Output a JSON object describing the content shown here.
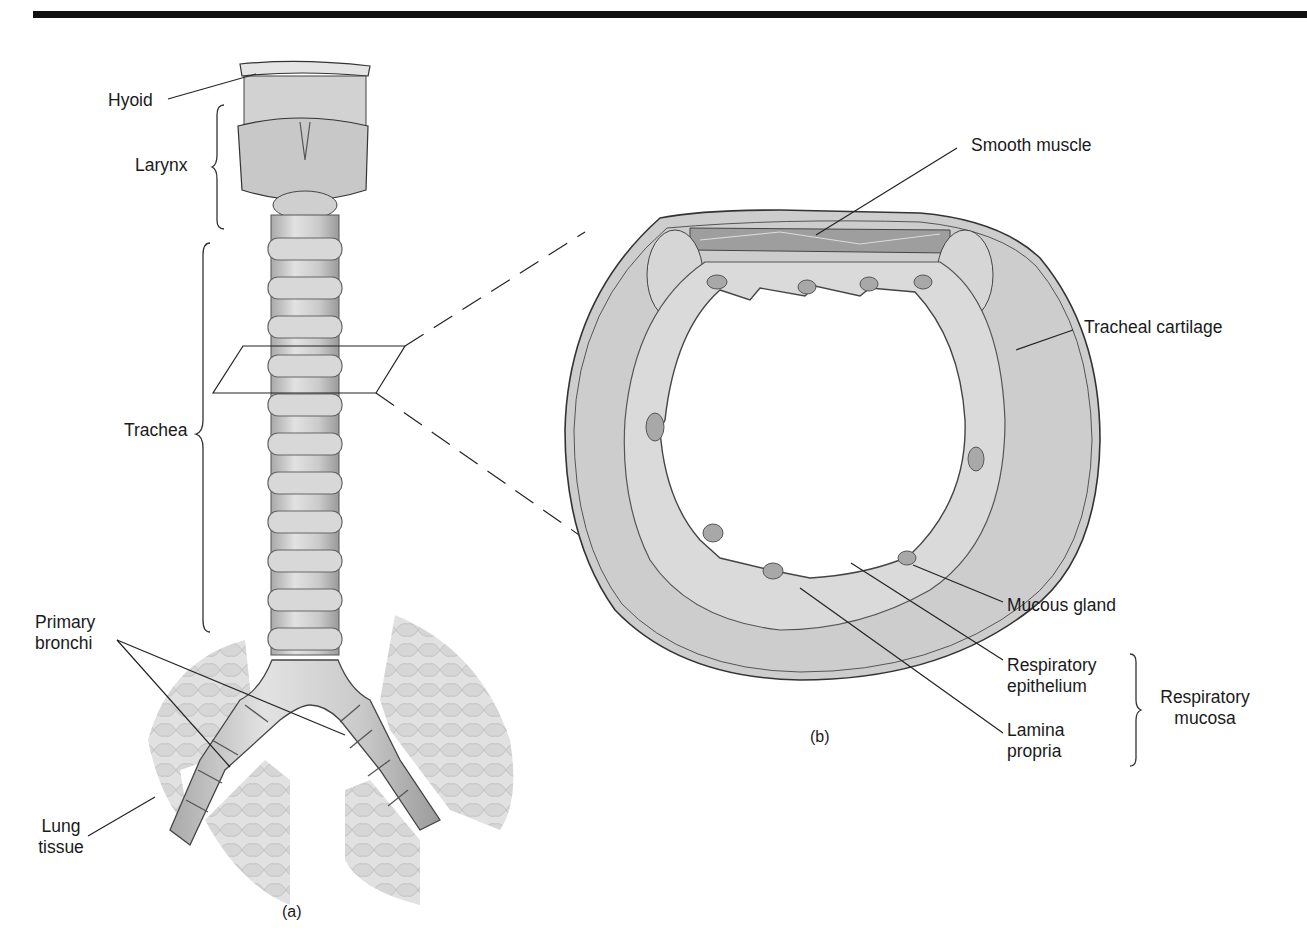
{
  "figure": {
    "panel_a": {
      "caption": "(a)",
      "labels": {
        "hyoid": "Hyoid",
        "larynx": "Larynx",
        "trachea": "Trachea",
        "primary_bronchi": [
          "Primary",
          "bronchi"
        ],
        "lung_tissue": [
          "Lung",
          "tissue"
        ]
      }
    },
    "panel_b": {
      "caption": "(b)",
      "labels": {
        "smooth_muscle": "Smooth muscle",
        "tracheal_cartilage": "Tracheal cartilage",
        "mucous_gland": "Mucous gland",
        "respiratory_epithelium": [
          "Respiratory",
          "epithelium"
        ],
        "lamina_propria": [
          "Lamina",
          "propria"
        ],
        "respiratory_mucosa": [
          "Respiratory",
          "mucosa"
        ]
      }
    },
    "colors": {
      "rule": "#111111",
      "tissue_fill": "#cfcfcf",
      "tissue_dark": "#9a9a9a",
      "outline": "#333333",
      "background": "#ffffff"
    }
  }
}
